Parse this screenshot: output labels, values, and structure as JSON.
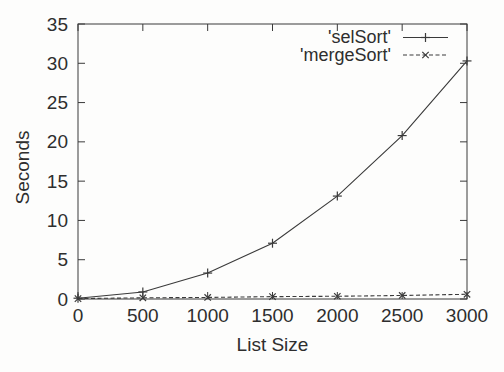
{
  "figure": {
    "background": "#fdfdfc",
    "line_color": "#3a3a3a",
    "text_color": "#2e2e2e"
  },
  "chart_data": {
    "type": "line",
    "title": "",
    "xlabel": "List Size",
    "ylabel": "Seconds",
    "x": [
      0,
      500,
      1000,
      1500,
      2000,
      2500,
      3000
    ],
    "series": [
      {
        "name": "'selSort'",
        "values": [
          0.1,
          0.9,
          3.3,
          7.1,
          13.1,
          20.8,
          30.3
        ],
        "line_style": "solid",
        "marker": "plus"
      },
      {
        "name": "'mergeSort'",
        "values": [
          0.05,
          0.15,
          0.2,
          0.3,
          0.35,
          0.45,
          0.6
        ],
        "line_style": "dashed",
        "marker": "cross"
      }
    ],
    "xlim": [
      0,
      3000
    ],
    "ylim": [
      0,
      35
    ],
    "x_ticks": [
      0,
      500,
      1000,
      1500,
      2000,
      2500,
      3000
    ],
    "y_ticks": [
      0,
      5,
      10,
      15,
      20,
      25,
      30,
      35
    ],
    "grid": false,
    "legend_position": "top-right-inside",
    "tick_mirror": true
  }
}
